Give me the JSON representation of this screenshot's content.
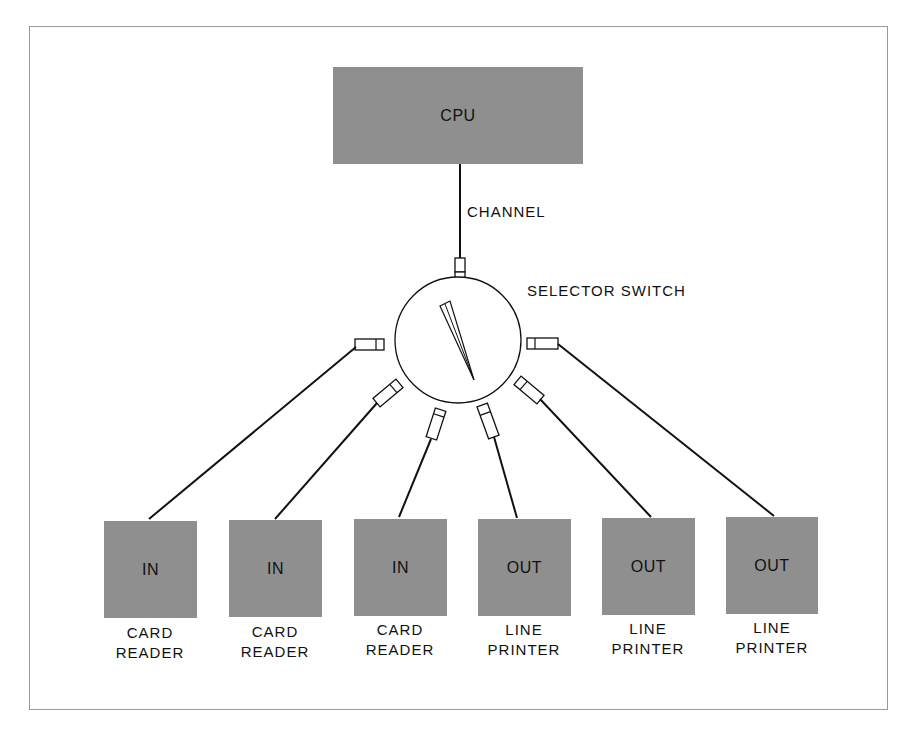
{
  "diagram": {
    "cpu": {
      "label": "CPU"
    },
    "channel": {
      "label": "CHANNEL"
    },
    "selector_switch": {
      "label": "SELECTOR SWITCH"
    },
    "devices": [
      {
        "type": "IN",
        "caption_line1": "CARD",
        "caption_line2": "READER"
      },
      {
        "type": "IN",
        "caption_line1": "CARD",
        "caption_line2": "READER"
      },
      {
        "type": "IN",
        "caption_line1": "CARD",
        "caption_line2": "READER"
      },
      {
        "type": "OUT",
        "caption_line1": "LINE",
        "caption_line2": "PRINTER"
      },
      {
        "type": "OUT",
        "caption_line1": "LINE",
        "caption_line2": "PRINTER"
      },
      {
        "type": "OUT",
        "caption_line1": "LINE",
        "caption_line2": "PRINTER"
      }
    ],
    "colors": {
      "box_fill": "#8f8f8f",
      "line": "#111111",
      "frame": "#9a9a9a"
    }
  }
}
